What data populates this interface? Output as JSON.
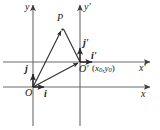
{
  "figure": {
    "type": "geometry-diagram",
    "canvas": {
      "width": 160,
      "height": 130
    },
    "background_color": "#ffffff",
    "stroke_color": "#4a4a4a",
    "text_color": "#1a1a1a"
  },
  "axes": [
    {
      "name": "x-axis",
      "label": "x",
      "orientation": "horizontal",
      "y": 87,
      "x_start": 3,
      "x_end": 152,
      "arrow": "right"
    },
    {
      "name": "y-axis",
      "label": "y",
      "orientation": "vertical",
      "x": 33,
      "y_start": 125,
      "y_end": 4,
      "arrow": "up"
    },
    {
      "name": "x-prime-axis",
      "label": "x'",
      "orientation": "horizontal",
      "y": 62,
      "x_start": 3,
      "x_end": 152,
      "arrow": "right"
    },
    {
      "name": "y-prime-axis",
      "label": "y'",
      "orientation": "vertical",
      "x": 80,
      "y_start": 125,
      "y_end": 4,
      "arrow": "up"
    }
  ],
  "labels": {
    "y": "y",
    "y_prime": "y'",
    "x": "x",
    "x_prime": "x'",
    "origin": "O",
    "origin_prime": "O'",
    "origin_prime_coords_open": "(",
    "origin_prime_coords_x": "x",
    "origin_prime_coords_x_sub": "0",
    "origin_prime_coords_comma": ",",
    "origin_prime_coords_y": "y",
    "origin_prime_coords_y_sub": "0",
    "origin_prime_coords_close": ")",
    "point_p": "P",
    "unit_i": "i",
    "unit_j": "j",
    "unit_i_prime": "i'",
    "unit_j_prime": "j'"
  },
  "points": [
    {
      "name": "O",
      "label": "O",
      "x": 33,
      "y": 87
    },
    {
      "name": "O'",
      "label": "O'",
      "x": 80,
      "y": 62
    },
    {
      "name": "P",
      "label": "P",
      "x": 62,
      "y": 28
    }
  ],
  "vectors": [
    {
      "name": "OP",
      "from": "O",
      "to": "P",
      "description": "position vector of P in xOy"
    },
    {
      "name": "OO'",
      "from": "O",
      "to": "O'",
      "description": "translation vector between origins"
    },
    {
      "name": "O'P",
      "from": "O'",
      "to": "P",
      "description": "position vector of P in x'O'y'"
    },
    {
      "name": "i",
      "from": "O",
      "to": "unit along x",
      "description": "unit vector of x-axis"
    },
    {
      "name": "j",
      "from": "O",
      "to": "unit along y",
      "description": "unit vector of y-axis"
    },
    {
      "name": "i'",
      "from": "O'",
      "to": "unit along x'",
      "description": "unit vector of x'-axis"
    },
    {
      "name": "j'",
      "from": "O'",
      "to": "unit along y'",
      "description": "unit vector of y'-axis"
    }
  ]
}
